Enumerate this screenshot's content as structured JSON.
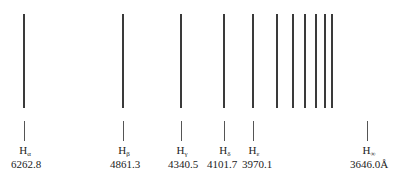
{
  "lines_x": [
    24,
    123,
    181,
    224,
    253,
    277,
    293,
    305,
    316,
    325,
    332
  ],
  "labels": [
    {
      "symbol": "H",
      "sub": "α",
      "wavelength": "6262.8",
      "x": 24
    },
    {
      "symbol": "H",
      "sub": "β",
      "wavelength": "4861.3",
      "x": 123
    },
    {
      "symbol": "H",
      "sub": "γ",
      "wavelength": "4340.5",
      "x": 181
    },
    {
      "symbol": "H",
      "sub": "δ",
      "wavelength": "4101.7",
      "x": 224
    },
    {
      "symbol": "H",
      "sub": "ε",
      "wavelength": "3970.1",
      "x": 253
    },
    {
      "symbol": "H",
      "sub": "∞",
      "wavelength": "3646.0Å",
      "x": 367
    }
  ]
}
